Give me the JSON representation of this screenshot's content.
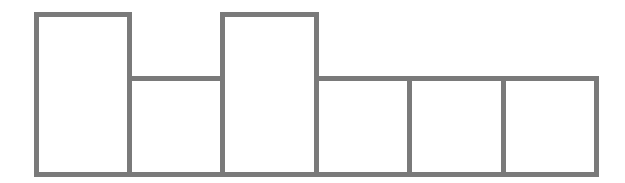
{
  "diagram": {
    "type": "block-outline-bars",
    "border_color": "#7a7a7a",
    "background": "#ffffff",
    "baseline_y": 177,
    "bars": [
      {
        "left": 34,
        "width": 98,
        "top": 12,
        "level": "tall"
      },
      {
        "left": 127,
        "width": 98,
        "top": 76,
        "level": "short"
      },
      {
        "left": 220,
        "width": 99,
        "top": 12,
        "level": "tall"
      },
      {
        "left": 314,
        "width": 98,
        "top": 76,
        "level": "short"
      },
      {
        "left": 407,
        "width": 99,
        "top": 76,
        "level": "short"
      },
      {
        "left": 501,
        "width": 98,
        "top": 76,
        "level": "short"
      }
    ]
  }
}
